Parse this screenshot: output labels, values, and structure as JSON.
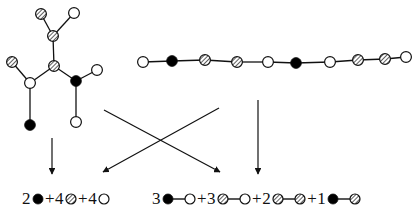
{
  "figure": {
    "colors": {
      "stroke": "#111111",
      "filled": "#000000",
      "open": "#ffffff",
      "hatched_line": "#222222",
      "background": "#ffffff"
    },
    "node_types": {
      "filled": "filled-circle",
      "open": "open-circle",
      "hatched": "hatched-circle"
    },
    "tree": {
      "name": "branched-tree-graph",
      "nodes": [
        {
          "id": "t1",
          "type": "hatched",
          "x": 41,
          "y": 14
        },
        {
          "id": "t2",
          "type": "open",
          "x": 74,
          "y": 13
        },
        {
          "id": "t3",
          "type": "hatched",
          "x": 53,
          "y": 36
        },
        {
          "id": "t4",
          "type": "hatched",
          "x": 54,
          "y": 66
        },
        {
          "id": "t5",
          "type": "hatched",
          "x": 12,
          "y": 62
        },
        {
          "id": "t6",
          "type": "open",
          "x": 30,
          "y": 83
        },
        {
          "id": "t7",
          "type": "filled",
          "x": 30,
          "y": 125
        },
        {
          "id": "t8",
          "type": "filled",
          "x": 76,
          "y": 81
        },
        {
          "id": "t9",
          "type": "open",
          "x": 97,
          "y": 70
        },
        {
          "id": "t10",
          "type": "open",
          "x": 76,
          "y": 122
        }
      ],
      "edges": [
        [
          "t1",
          "t3"
        ],
        [
          "t2",
          "t3"
        ],
        [
          "t3",
          "t4"
        ],
        [
          "t4",
          "t6"
        ],
        [
          "t5",
          "t6"
        ],
        [
          "t6",
          "t7"
        ],
        [
          "t4",
          "t8"
        ],
        [
          "t8",
          "t9"
        ],
        [
          "t8",
          "t10"
        ]
      ]
    },
    "chain": {
      "name": "linear-chain-graph",
      "nodes": [
        {
          "id": "c1",
          "type": "open",
          "x": 143,
          "y": 62
        },
        {
          "id": "c2",
          "type": "filled",
          "x": 172,
          "y": 61
        },
        {
          "id": "c3",
          "type": "hatched",
          "x": 205,
          "y": 60
        },
        {
          "id": "c4",
          "type": "hatched",
          "x": 237,
          "y": 62
        },
        {
          "id": "c5",
          "type": "open",
          "x": 268,
          "y": 62
        },
        {
          "id": "c6",
          "type": "filled",
          "x": 296,
          "y": 63
        },
        {
          "id": "c7",
          "type": "open",
          "x": 330,
          "y": 62
        },
        {
          "id": "c8",
          "type": "hatched",
          "x": 358,
          "y": 60
        },
        {
          "id": "c9",
          "type": "hatched",
          "x": 385,
          "y": 59
        },
        {
          "id": "c10",
          "type": "open",
          "x": 406,
          "y": 57
        }
      ],
      "edges": [
        [
          "c1",
          "c2"
        ],
        [
          "c2",
          "c3"
        ],
        [
          "c3",
          "c4"
        ],
        [
          "c4",
          "c5"
        ],
        [
          "c5",
          "c6"
        ],
        [
          "c6",
          "c7"
        ],
        [
          "c7",
          "c8"
        ],
        [
          "c8",
          "c9"
        ],
        [
          "c9",
          "c10"
        ]
      ]
    },
    "arrows": [
      {
        "name": "arrow-tree-to-vertices",
        "x1": 52,
        "y1": 138,
        "x2": 52,
        "y2": 174
      },
      {
        "name": "arrow-tree-to-edges",
        "x1": 104,
        "y1": 110,
        "x2": 220,
        "y2": 172
      },
      {
        "name": "arrow-chain-to-vertices",
        "x1": 219,
        "y1": 108,
        "x2": 103,
        "y2": 172
      },
      {
        "name": "arrow-chain-to-edges",
        "x1": 258,
        "y1": 100,
        "x2": 258,
        "y2": 174
      }
    ]
  },
  "formula_vertices": {
    "name": "vertex-count-formula",
    "terms": [
      {
        "count": "2",
        "node": "filled"
      },
      {
        "count": "4",
        "node": "hatched"
      },
      {
        "count": "4",
        "node": "open"
      }
    ],
    "plus": "+",
    "text": "2 filled + 4 hatched + 4 open"
  },
  "formula_edges": {
    "name": "edge-count-formula",
    "terms": [
      {
        "count": "3",
        "from": "filled",
        "to": "open"
      },
      {
        "count": "3",
        "from": "hatched",
        "to": "open"
      },
      {
        "count": "2",
        "from": "hatched",
        "to": "hatched"
      },
      {
        "count": "1",
        "from": "filled",
        "to": "hatched"
      }
    ],
    "plus": "+",
    "text": "3 filled-open + 3 hatched-open + 2 hatched-hatched + 1 filled-hatched"
  }
}
